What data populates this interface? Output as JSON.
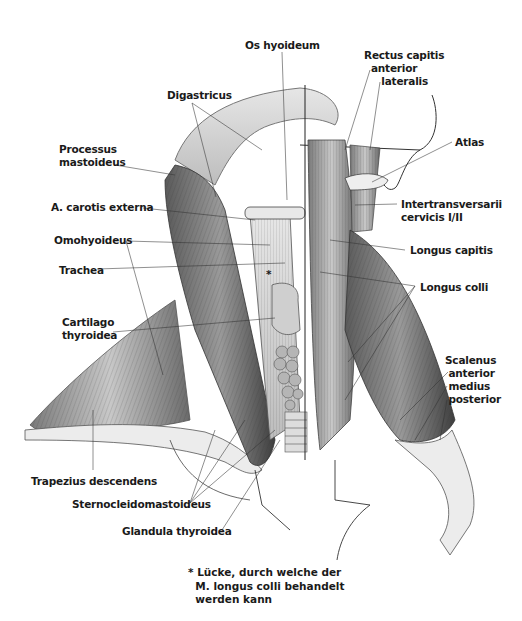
{
  "figure": {
    "type": "anatomical-illustration",
    "labels": {
      "os_hyoideum": "Os hyoideum",
      "rectus_capitis": "Rectus capitis\n  anterior\n     lateralis",
      "digastricus": "Digastricus",
      "processus_mastoideus": "Processus\nmastoideus",
      "atlas": "Atlas",
      "carotis_externa": "A. carotis externa",
      "intertransversarii": "Intertransversarii\ncervicis I/II",
      "omohyoideus": "Omohyoideus",
      "longus_capitis": "Longus capitis",
      "trachea": "Trachea",
      "longus_colli": "Longus colli",
      "cartilago_thyroidea": "Cartilago\nthyroidea",
      "scalenus": "Scalenus\n anterior\n medius\n posterior",
      "trapezius": "Trapezius descendens",
      "sternocleidomastoideus": "Sternocleidomastoideus",
      "glandula_thyroidea": "Glandula thyroidea"
    },
    "asterisk": "*",
    "footnote": "* Lücke, durch welche der\n  M. longus colli behandelt\n  werden kann"
  },
  "colors": {
    "background": "#ffffff",
    "text": "#1a1a1a",
    "leader": "#333333",
    "muscle_dark": "#4a4a4a",
    "muscle_mid": "#8a8a8a",
    "muscle_light": "#d4d4d4"
  }
}
